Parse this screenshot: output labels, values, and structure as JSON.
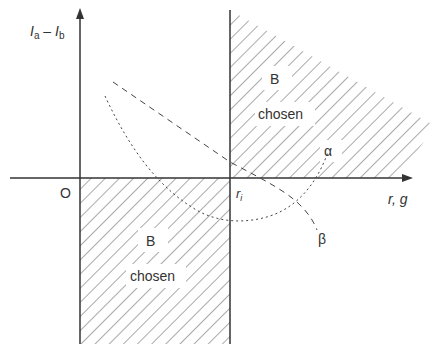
{
  "diagram": {
    "y_axis_label": {
      "main": "I",
      "sub_a": "a",
      "minus": " – ",
      "main2": "I",
      "sub_b": "b"
    },
    "x_axis_label": "r, g",
    "origin_label": "O",
    "threshold_label": {
      "main": "r",
      "sub": "i"
    },
    "regions": [
      {
        "id": "upper",
        "line1": "B",
        "line2": "chosen"
      },
      {
        "id": "lower",
        "line1": "B",
        "line2": "chosen"
      }
    ],
    "curves": [
      {
        "id": "alpha",
        "label": "α",
        "style": "dotted"
      },
      {
        "id": "beta",
        "label": "β",
        "style": "dashed"
      }
    ],
    "colors": {
      "ink": "#333333",
      "hatch": "#555555",
      "background": "#ffffff"
    }
  }
}
